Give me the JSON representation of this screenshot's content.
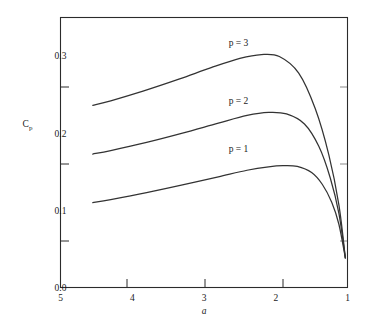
{
  "chart_data": {
    "type": "line",
    "title": "",
    "subtitle": "",
    "xlabel": "a",
    "ylabel": "Cp",
    "ylabel_base": "C",
    "ylabel_sub": "p",
    "xlim": [
      1,
      5
    ],
    "ylim": [
      0.0,
      0.35
    ],
    "xticks": [
      1,
      2,
      3,
      4,
      5
    ],
    "xticklabels": [
      "1",
      "2",
      "3",
      "4",
      "5"
    ],
    "yticks": [
      0.0,
      0.1,
      0.2,
      0.3
    ],
    "yticklabels": [
      "0.0",
      "0.1",
      "0.2",
      "0.3"
    ],
    "grid": false,
    "legend_position": "inline-curve-labels",
    "mirrored": true,
    "frame": "box",
    "series": [
      {
        "name": "p = 1",
        "label": "p = 1",
        "label_x": 2.52,
        "label_y": 0.1755,
        "points": [
          [
            1.03,
            0.0385
          ],
          [
            1.12,
            0.082
          ],
          [
            1.22,
            0.1105
          ],
          [
            1.35,
            0.1335
          ],
          [
            1.5,
            0.149
          ],
          [
            1.7,
            0.157
          ],
          [
            1.9,
            0.158
          ],
          [
            2.1,
            0.1565
          ],
          [
            2.4,
            0.152
          ],
          [
            2.8,
            0.1435
          ],
          [
            3.3,
            0.133
          ],
          [
            3.8,
            0.123
          ],
          [
            4.3,
            0.114
          ],
          [
            4.55,
            0.11
          ]
        ]
      },
      {
        "name": "p = 2",
        "label": "p = 2",
        "label_x": 2.52,
        "label_y": 0.238,
        "points": [
          [
            1.03,
            0.0385
          ],
          [
            1.12,
            0.096
          ],
          [
            1.24,
            0.142
          ],
          [
            1.4,
            0.183
          ],
          [
            1.6,
            0.212
          ],
          [
            1.85,
            0.225
          ],
          [
            2.1,
            0.227
          ],
          [
            2.4,
            0.223
          ],
          [
            2.8,
            0.213
          ],
          [
            3.3,
            0.2
          ],
          [
            3.8,
            0.188
          ],
          [
            4.3,
            0.1775
          ],
          [
            4.55,
            0.173
          ]
        ]
      },
      {
        "name": "p = 3",
        "label": "p = 3",
        "label_x": 2.52,
        "label_y": 0.3135,
        "points": [
          [
            1.03,
            0.0385
          ],
          [
            1.12,
            0.107
          ],
          [
            1.26,
            0.172
          ],
          [
            1.45,
            0.232
          ],
          [
            1.68,
            0.278
          ],
          [
            1.95,
            0.2995
          ],
          [
            2.2,
            0.302
          ],
          [
            2.5,
            0.297
          ],
          [
            2.9,
            0.285
          ],
          [
            3.35,
            0.27
          ],
          [
            3.85,
            0.2545
          ],
          [
            4.3,
            0.242
          ],
          [
            4.55,
            0.236
          ]
        ]
      }
    ]
  },
  "axes": {
    "x_axis_name": "a",
    "y_axis_name": "Cp"
  }
}
